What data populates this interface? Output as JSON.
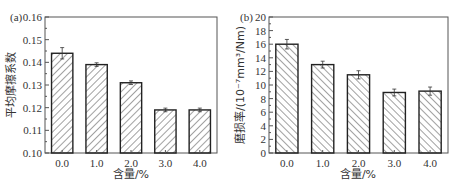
{
  "chart_data": [
    {
      "type": "bar",
      "panel": "(a)",
      "title": "",
      "xlabel": "含量/%",
      "ylabel": "平均摩擦系数",
      "categories": [
        "0.0",
        "1.0",
        "2.0",
        "3.0",
        "4.0"
      ],
      "values": [
        0.144,
        0.139,
        0.131,
        0.119,
        0.119
      ],
      "errors": [
        0.0025,
        0.0008,
        0.0008,
        0.0008,
        0.0008
      ],
      "ylim": [
        0.1,
        0.16
      ],
      "yticks": [
        "0.10",
        "0.11",
        "0.12",
        "0.13",
        "0.14",
        "0.15",
        "0.16"
      ],
      "hatch": "forward-diagonal",
      "grid": false,
      "legend": null
    },
    {
      "type": "bar",
      "panel": "(b)",
      "title": "",
      "xlabel": "含量/%",
      "ylabel": "磨损率/(10⁻⁷mm³/Nm)",
      "categories": [
        "0.0",
        "1.0",
        "2.0",
        "3.0",
        "4.0"
      ],
      "values": [
        16.0,
        13.0,
        11.5,
        8.9,
        9.1
      ],
      "errors": [
        0.7,
        0.5,
        0.6,
        0.5,
        0.6
      ],
      "ylim": [
        0,
        20
      ],
      "yticks": [
        "0",
        "2",
        "4",
        "6",
        "8",
        "10",
        "12",
        "14",
        "16",
        "18",
        "20"
      ],
      "hatch": "back-diagonal",
      "grid": false,
      "legend": null
    }
  ],
  "colors": {
    "axis": "#555555",
    "bar_edge": "#222222",
    "hatch": "#444444",
    "background": "#ffffff"
  }
}
